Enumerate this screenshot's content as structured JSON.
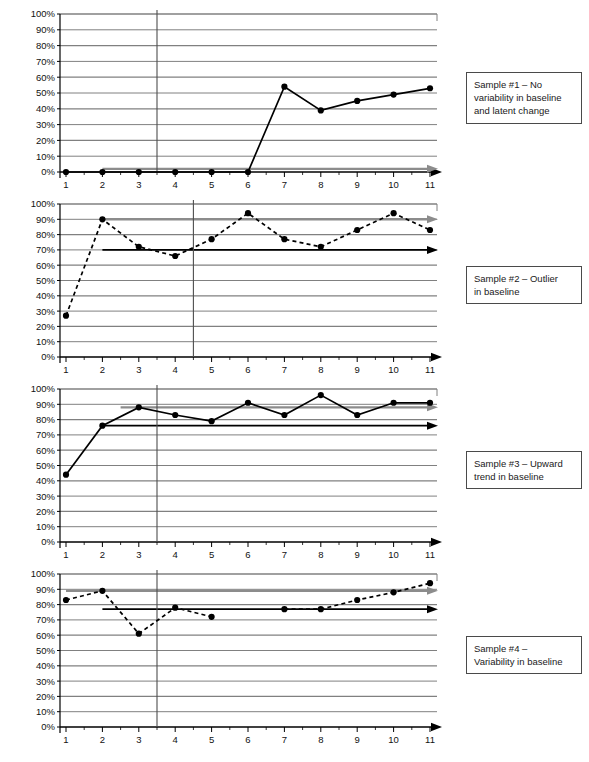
{
  "figure": {
    "title": "",
    "panel_count": 4,
    "colors": {
      "data_line": "#000000",
      "gridline": "#808080",
      "axis": "#000000",
      "level_line_gray": "#8c8c8c",
      "level_line_black": "#000000",
      "phase_line": "#4d4d4d",
      "callout_border": "#4a4a4a",
      "background": "#ffffff"
    },
    "axis": {
      "y_ticks": [
        "0%",
        "10%",
        "20%",
        "30%",
        "40%",
        "50%",
        "60%",
        "70%",
        "80%",
        "90%",
        "100%"
      ],
      "x_ticks": [
        "1",
        "2",
        "3",
        "4",
        "5",
        "6",
        "7",
        "8",
        "9",
        "10",
        "11"
      ],
      "ylim": [
        0,
        100
      ],
      "xlim": [
        1,
        11
      ],
      "grid": true,
      "x_axis_arrow": true
    }
  },
  "chart_data": [
    {
      "type": "line",
      "id": "sample-1",
      "title": "Sample #1 – No variability in baseline and latent change",
      "callout_lines": [
        "Sample #1 – No",
        "variability in baseline",
        "and latent change"
      ],
      "xlabel": "",
      "ylabel": "",
      "ylim": [
        0,
        100
      ],
      "categories": [
        1,
        2,
        3,
        4,
        5,
        6,
        7,
        8,
        9,
        10,
        11
      ],
      "series": [
        {
          "name": "data",
          "style": "solid",
          "marker": "filled-circle",
          "values": [
            0,
            0,
            0,
            0,
            0,
            0,
            54,
            39,
            45,
            49,
            53
          ]
        }
      ],
      "phase_line_x": 3.5,
      "trend_lines": [
        {
          "name": "baseline-level-gray",
          "color": "gray",
          "y_start": 2,
          "y_end": 2,
          "x_start": 2,
          "x_end": 11,
          "arrow": true
        }
      ]
    },
    {
      "type": "line",
      "id": "sample-2",
      "title": "Sample #2 – Outlier in baseline",
      "callout_lines": [
        "Sample #2 – Outlier",
        "in baseline"
      ],
      "xlabel": "",
      "ylabel": "",
      "ylim": [
        0,
        100
      ],
      "categories": [
        1,
        2,
        3,
        4,
        5,
        6,
        7,
        8,
        9,
        10,
        11
      ],
      "series": [
        {
          "name": "data",
          "style": "dashed",
          "marker": "filled-circle",
          "values": [
            27,
            90,
            72,
            66,
            77,
            94,
            77,
            72,
            83,
            94,
            83
          ]
        }
      ],
      "phase_line_x": 4.5,
      "trend_lines": [
        {
          "name": "baseline-level-gray",
          "color": "gray",
          "y_start": 90,
          "y_end": 90,
          "x_start": 2,
          "x_end": 11,
          "arrow": true
        },
        {
          "name": "baseline-level-black",
          "color": "black",
          "y_start": 70,
          "y_end": 70,
          "x_start": 2,
          "x_end": 11,
          "arrow": true
        }
      ]
    },
    {
      "type": "line",
      "id": "sample-3",
      "title": "Sample #3 – Upward trend in baseline",
      "callout_lines": [
        "Sample #3 – Upward",
        "trend in baseline"
      ],
      "xlabel": "",
      "ylabel": "",
      "ylim": [
        0,
        100
      ],
      "categories": [
        1,
        2,
        3,
        4,
        5,
        6,
        7,
        8,
        9,
        10,
        11
      ],
      "series": [
        {
          "name": "data",
          "style": "solid",
          "marker": "filled-circle",
          "values": [
            44,
            76,
            88,
            83,
            79,
            91,
            83,
            96,
            83,
            91,
            91
          ]
        }
      ],
      "phase_line_x": 3.5,
      "trend_lines": [
        {
          "name": "baseline-level-gray",
          "color": "gray",
          "y_start": 88,
          "y_end": 88,
          "x_start": 2.5,
          "x_end": 11,
          "arrow": true
        },
        {
          "name": "baseline-level-black",
          "color": "black",
          "y_start": 76,
          "y_end": 76,
          "x_start": 2,
          "x_end": 11,
          "arrow": true
        }
      ]
    },
    {
      "type": "line",
      "id": "sample-4",
      "title": "Sample #4 – Variability in baseline",
      "callout_lines": [
        "Sample #4 –",
        "Variability in baseline"
      ],
      "xlabel": "",
      "ylabel": "",
      "ylim": [
        0,
        100
      ],
      "categories": [
        1,
        2,
        3,
        4,
        5,
        6,
        7,
        8,
        9,
        10,
        11
      ],
      "series": [
        {
          "name": "data",
          "style": "dashed",
          "marker": "filled-circle",
          "values": [
            83,
            89,
            61,
            78,
            72,
            null,
            77,
            77,
            83,
            88,
            94
          ]
        }
      ],
      "phase_line_x": 3.5,
      "trend_lines": [
        {
          "name": "baseline-level-gray",
          "color": "gray",
          "y_start": 89,
          "y_end": 89,
          "x_start": 1,
          "x_end": 11,
          "arrow": true
        },
        {
          "name": "baseline-level-black",
          "color": "black",
          "y_start": 77,
          "y_end": 77,
          "x_start": 2,
          "x_end": 11,
          "arrow": true
        }
      ]
    }
  ]
}
